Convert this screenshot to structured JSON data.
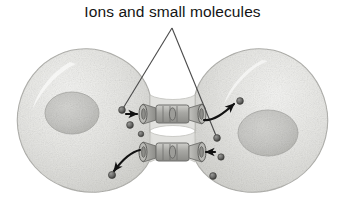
{
  "figure": {
    "kind": "biology-illustration",
    "width": 345,
    "height": 221,
    "background_color": "#ffffff"
  },
  "caption": {
    "label": "Ions and small molecules"
  },
  "palette": {
    "background": "#ffffff",
    "cell_fill": "#e3e3e1",
    "cell_fill_light": "#efefed",
    "cell_edge": "#b9b9b6",
    "nucleus_fill": "#c9c9c6",
    "nucleus_edge": "#adadaa",
    "channel_fill": "#b0b0ac",
    "channel_edge": "#6f6f6c",
    "ion_fill": "#6d6d6b",
    "ion_edge": "#3a3a38",
    "arrow": "#111111",
    "leader_line": "#4a4a4a",
    "text": "#141414"
  },
  "cells": [
    {
      "name": "left-cell",
      "nucleus_label": "left-nucleus"
    },
    {
      "name": "right-cell",
      "nucleus_label": "right-nucleus"
    }
  ],
  "channels": [
    {
      "name": "upper-gap-junction-channel"
    },
    {
      "name": "lower-gap-junction-channel"
    }
  ],
  "ions": [
    {
      "name": "ion-left-upper-a",
      "cx": 122,
      "cy": 110,
      "r": 3.4
    },
    {
      "name": "ion-left-upper-b",
      "cx": 130,
      "cy": 125,
      "r": 3.4
    },
    {
      "name": "ion-left-mid",
      "cx": 141,
      "cy": 134,
      "r": 2.8
    },
    {
      "name": "ion-left-lower",
      "cx": 112,
      "cy": 175,
      "r": 3.6
    },
    {
      "name": "ion-right-upper",
      "cx": 240,
      "cy": 101,
      "r": 3.4
    },
    {
      "name": "ion-right-mid-a",
      "cx": 217,
      "cy": 138,
      "r": 3.4
    },
    {
      "name": "ion-right-mid-b",
      "cx": 221,
      "cy": 157,
      "r": 3.2
    },
    {
      "name": "ion-right-lower",
      "cx": 213,
      "cy": 176,
      "r": 3.4
    }
  ],
  "arrows": [
    {
      "name": "arrow-into-upper-channel-left",
      "direction": "right"
    },
    {
      "name": "arrow-out-of-upper-channel-right",
      "direction": "up-right"
    },
    {
      "name": "arrow-out-of-lower-channel-left",
      "direction": "down-left"
    },
    {
      "name": "arrow-into-lower-channel-right",
      "direction": "left"
    }
  ],
  "leader_lines": [
    {
      "name": "leader-line-left",
      "from": "caption",
      "to": "ion-left-upper-a"
    },
    {
      "name": "leader-line-right",
      "from": "caption",
      "to": "ion-right-mid-a"
    }
  ]
}
